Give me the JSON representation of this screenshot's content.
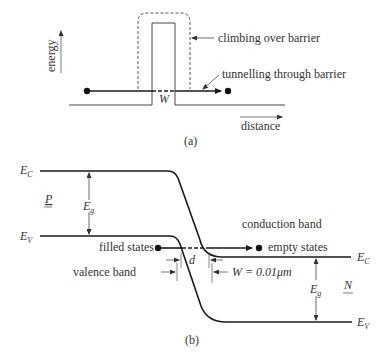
{
  "figure_a": {
    "axis_y_label": "energy",
    "axis_x_label": "distance",
    "annotation_climb": "climbing over barrier",
    "annotation_tunnel": "tunnelling through barrier",
    "barrier_width_label": "W",
    "caption": "(a)"
  },
  "figure_b": {
    "ec_left": "E",
    "ec_left_sub": "C",
    "ev_left": "E",
    "ev_left_sub": "V",
    "ec_right": "E",
    "ec_right_sub": "C",
    "ev_right": "E",
    "ev_right_sub": "V",
    "eg_left": "E",
    "eg_left_sub": "g",
    "eg_right": "E",
    "eg_right_sub": "g",
    "region_p": "P",
    "region_n": "N",
    "conduction_band": "conduction band",
    "valence_band": "valence band",
    "filled_states": "filled states",
    "empty_states": "empty states",
    "d_label": "d",
    "width_label": "W = 0.01μm",
    "caption": "(b)"
  },
  "colors": {
    "line": "#1a1a1a",
    "text": "#333333",
    "thin": "#555555"
  }
}
